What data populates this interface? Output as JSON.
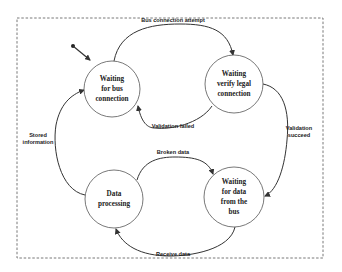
{
  "diagram": {
    "type": "state-machine",
    "frame": {
      "style": "dashed"
    },
    "colors": {
      "stroke": "#333333",
      "text": "#222222",
      "background": "#ffffff"
    },
    "states": [
      {
        "id": "s1",
        "lines": [
          "Waiting",
          "for bus",
          "connection"
        ],
        "initial": true
      },
      {
        "id": "s2",
        "lines": [
          "Waiting",
          "verify legal",
          "connection"
        ]
      },
      {
        "id": "s3",
        "lines": [
          "Data",
          "processing"
        ]
      },
      {
        "id": "s4",
        "lines": [
          "Waiting",
          "for data",
          "from the",
          "bus"
        ]
      }
    ],
    "transitions": [
      {
        "from": "s1",
        "to": "s2",
        "label": "Bus connection attempt"
      },
      {
        "from": "s2",
        "to": "s1",
        "label": "Validation failed"
      },
      {
        "from": "s2",
        "to": "s4",
        "label_lines": [
          "Validation",
          "succeed"
        ]
      },
      {
        "from": "s4",
        "to": "s3",
        "label": "Receive data"
      },
      {
        "from": "s3",
        "to": "s4",
        "label": "Broken data"
      },
      {
        "from": "s3",
        "to": "s1",
        "label_lines": [
          "Stored",
          "information"
        ]
      }
    ]
  }
}
